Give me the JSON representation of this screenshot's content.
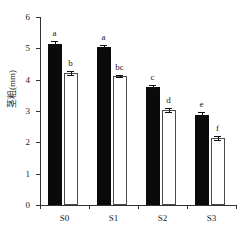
{
  "chart_data": {
    "type": "bar",
    "title": "",
    "xlabel": "",
    "ylabel": "茎粗(mm)",
    "categories": [
      "S0",
      "S1",
      "S2",
      "S3"
    ],
    "ylim": [
      0,
      6
    ],
    "yticks": [
      0,
      1,
      2,
      3,
      4,
      5,
      6
    ],
    "ytick_labels": [
      "0",
      "1",
      "2",
      "3",
      "4",
      "5",
      "6"
    ],
    "grid": false,
    "legend": "none",
    "series": [
      {
        "name": "filled",
        "fill": "#0a0a0a",
        "values": [
          5.15,
          5.05,
          3.77,
          2.88
        ],
        "errors": [
          0.1,
          0.06,
          0.06,
          0.08
        ],
        "letters": [
          "a",
          "a",
          "c",
          "e"
        ]
      },
      {
        "name": "open",
        "fill": "#ffffff",
        "values": [
          4.22,
          4.12,
          3.03,
          2.14
        ],
        "errors": [
          0.07,
          0.04,
          0.05,
          0.06
        ],
        "letters": [
          "b",
          "bc",
          "d",
          "f"
        ]
      }
    ]
  },
  "axis": {
    "y_title": "茎粗(mm)",
    "tick_0": "0",
    "tick_1": "1",
    "tick_2": "2",
    "tick_3": "3",
    "tick_4": "4",
    "tick_5": "5",
    "tick_6": "6",
    "cat_0": "S0",
    "cat_1": "S1",
    "cat_2": "S2",
    "cat_3": "S3"
  },
  "letters": {
    "s0_filled": "a",
    "s0_open": "b",
    "s1_filled": "a",
    "s1_open": "bc",
    "s2_filled": "c",
    "s2_open": "d",
    "s3_filled": "e",
    "s3_open": "f"
  }
}
